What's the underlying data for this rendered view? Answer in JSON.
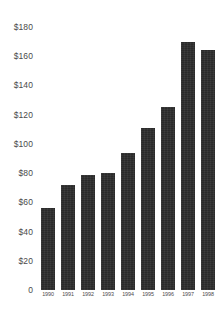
{
  "chart_data": {
    "type": "bar",
    "title": "",
    "xlabel": "",
    "ylabel": "",
    "categories": [
      "1990",
      "1991",
      "1992",
      "1993",
      "1994",
      "1995",
      "1996",
      "1997",
      "1998"
    ],
    "values": [
      56,
      72,
      79,
      80,
      94,
      111,
      125,
      170,
      164
    ],
    "value_prefix": "$",
    "ylim": [
      0,
      180
    ],
    "ytick_values": [
      180,
      160,
      140,
      120,
      100,
      80,
      60,
      40,
      20,
      0
    ],
    "ytick_labels": [
      "$180",
      "$160",
      "$140",
      "$120",
      "$100",
      "$80",
      "$60",
      "$40",
      "$20",
      "0"
    ],
    "grid": false,
    "legend": null,
    "bar_color": "#2e2e2e",
    "background_color": "#ffffff",
    "axis_text_color": "#4a4a4a"
  }
}
